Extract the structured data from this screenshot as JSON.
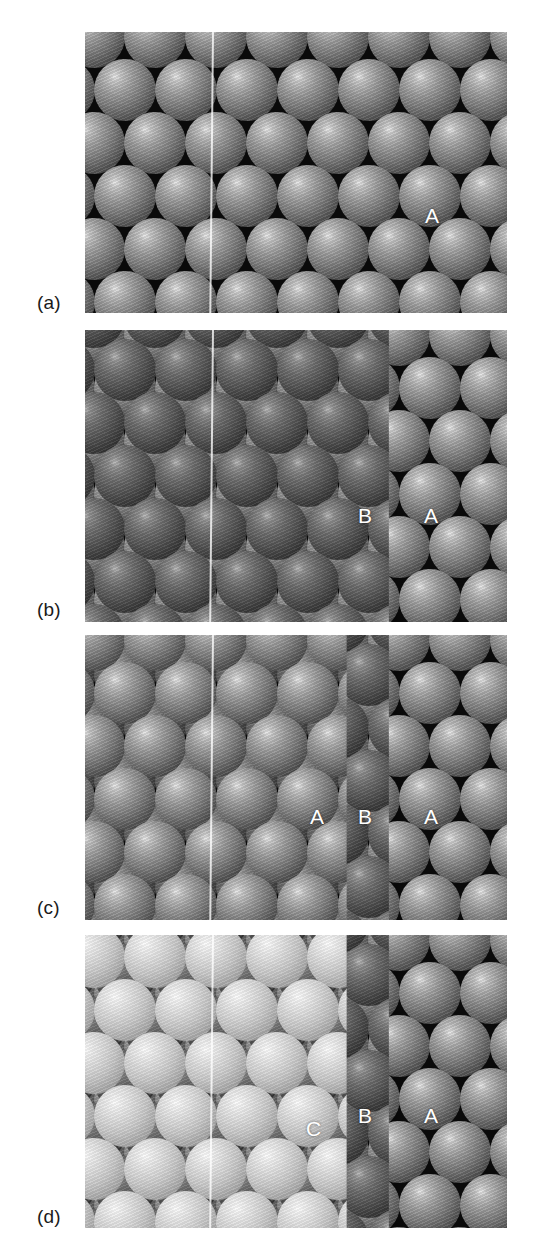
{
  "figure": {
    "background_color": "#ffffff",
    "width": 541,
    "height": 1258,
    "guide_line_color": "#ffffff"
  },
  "panels": [
    {
      "id": "a",
      "label": "(a)",
      "label_x": 37,
      "label_y": 293,
      "x": 85,
      "y": 32,
      "w": 422,
      "h": 281,
      "caption_meaning": "Single close-packed layer A",
      "layers": [
        {
          "name": "A",
          "shade": "mid-grey",
          "color": "#7a7a7a",
          "offset": "origin",
          "coverage": "full"
        }
      ],
      "site_labels": [
        {
          "text": "A",
          "x": 425,
          "y": 205
        }
      ]
    },
    {
      "id": "b",
      "label": "(b)",
      "label_x": 37,
      "label_y": 600,
      "x": 85,
      "y": 330,
      "w": 422,
      "h": 292,
      "caption_meaning": "Second layer B placed in the hollows of layer A",
      "layers": [
        {
          "name": "A",
          "shade": "mid-grey",
          "color": "#7a7a7a",
          "offset": "origin",
          "coverage": "full"
        },
        {
          "name": "B",
          "shade": "dark-grey",
          "color": "#545454",
          "offset": "B-hollow",
          "coverage": "left-0-to-72-percent"
        }
      ],
      "site_labels": [
        {
          "text": "B",
          "x": 358,
          "y": 505
        },
        {
          "text": "A",
          "x": 424,
          "y": 505
        }
      ]
    },
    {
      "id": "c",
      "label": "(c)",
      "label_x": 37,
      "label_y": 898,
      "x": 85,
      "y": 635,
      "w": 422,
      "h": 285,
      "caption_meaning": "Third layer returning to A sites - hexagonal close packing ABAB",
      "layers": [
        {
          "name": "A",
          "shade": "mid-grey",
          "color": "#7a7a7a",
          "offset": "origin",
          "coverage": "full"
        },
        {
          "name": "B",
          "shade": "dark-grey",
          "color": "#545454",
          "offset": "B-hollow",
          "coverage": "left-0-to-72-percent"
        },
        {
          "name": "A",
          "shade": "mid-grey",
          "color": "#7a7a7a",
          "offset": "origin",
          "coverage": "left-0-to-62-percent"
        }
      ],
      "site_labels": [
        {
          "text": "A",
          "x": 310,
          "y": 806
        },
        {
          "text": "B",
          "x": 358,
          "y": 806
        },
        {
          "text": "A",
          "x": 424,
          "y": 806
        }
      ]
    },
    {
      "id": "d",
      "label": "(d)",
      "label_x": 37,
      "label_y": 1207,
      "x": 85,
      "y": 935,
      "w": 422,
      "h": 293,
      "caption_meaning": "Third layer on C sites - cubic close packing ABCABC",
      "layers": [
        {
          "name": "A",
          "shade": "mid-grey",
          "color": "#7a7a7a",
          "offset": "origin",
          "coverage": "full"
        },
        {
          "name": "B",
          "shade": "dark-grey",
          "color": "#545454",
          "offset": "B-hollow",
          "coverage": "left-0-to-72-percent"
        },
        {
          "name": "C",
          "shade": "light-grey",
          "color": "#c6c6c6",
          "offset": "C-hollow",
          "coverage": "left-0-to-62-percent"
        }
      ],
      "site_labels": [
        {
          "text": "C",
          "x": 306,
          "y": 1118
        },
        {
          "text": "B",
          "x": 358,
          "y": 1105
        },
        {
          "text": "A",
          "x": 424,
          "y": 1105
        }
      ]
    }
  ],
  "lattice": {
    "sphere_diameter": 62,
    "column_spacing": 61,
    "row_spacing": 53,
    "row_stagger": 30.5
  },
  "chart_data": {
    "type": "diagram",
    "panels": [
      "(a)",
      "(b)",
      "(c)",
      "(d)"
    ],
    "annotations": [
      "A",
      "B",
      "C"
    ],
    "series": [
      {
        "name": "(a)",
        "values": [
          "A"
        ]
      },
      {
        "name": "(b)",
        "values": [
          "B",
          "A"
        ]
      },
      {
        "name": "(c)",
        "values": [
          "A",
          "B",
          "A"
        ]
      },
      {
        "name": "(d)",
        "values": [
          "C",
          "B",
          "A"
        ]
      }
    ]
  }
}
